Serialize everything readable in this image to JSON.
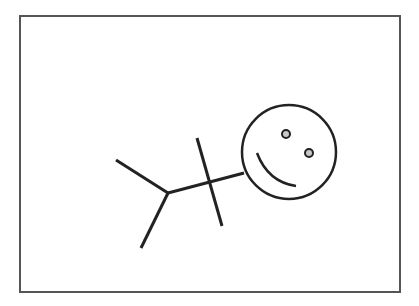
{
  "figure": {
    "colors": {
      "background": "#ffffff",
      "frame": "#555555",
      "stroke": "#222222",
      "eye_fill": "#c8c8c8"
    },
    "frame": {
      "x": 20,
      "y": 16,
      "width": 380,
      "height": 276
    },
    "head": {
      "cx": 289,
      "cy": 152,
      "r": 47
    },
    "eyes": [
      {
        "cx": 286,
        "cy": 134,
        "r": 4
      },
      {
        "cx": 309,
        "cy": 153,
        "r": 4
      }
    ],
    "mouth": {
      "path": "M 257 153 Q 268 182 296 186"
    },
    "spine": {
      "x1": 168,
      "y1": 193,
      "x2": 244,
      "y2": 173
    },
    "arms": {
      "x1": 197,
      "y1": 138,
      "x2": 222,
      "y2": 226
    },
    "legs": [
      {
        "x1": 116,
        "y1": 160,
        "x2": 168,
        "y2": 193
      },
      {
        "x1": 168,
        "y1": 193,
        "x2": 141,
        "y2": 248
      }
    ]
  }
}
